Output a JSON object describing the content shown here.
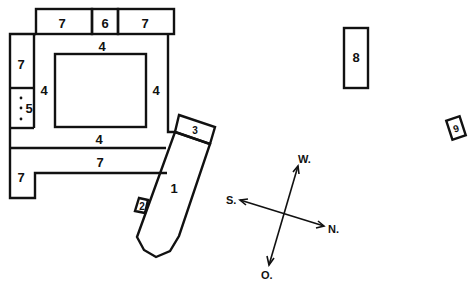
{
  "diagram": {
    "type": "site-plan",
    "buildings": [
      {
        "id": "top-left-7",
        "label": "7"
      },
      {
        "id": "top-6",
        "label": "6"
      },
      {
        "id": "top-right-7",
        "label": "7"
      },
      {
        "id": "left-7",
        "label": "7"
      },
      {
        "id": "left-5",
        "label": "5"
      },
      {
        "id": "courtyard-north-4",
        "label": "4"
      },
      {
        "id": "courtyard-west-4",
        "label": "4"
      },
      {
        "id": "courtyard-east-4",
        "label": "4"
      },
      {
        "id": "courtyard-south-4",
        "label": "4"
      },
      {
        "id": "bottom-7",
        "label": "7"
      },
      {
        "id": "bottom-left-7",
        "label": "7"
      },
      {
        "id": "building-1",
        "label": "1"
      },
      {
        "id": "building-2",
        "label": "2"
      },
      {
        "id": "building-3",
        "label": "3"
      },
      {
        "id": "building-8",
        "label": "8"
      },
      {
        "id": "building-9",
        "label": "9"
      }
    ],
    "compass": {
      "west": "W.",
      "south": "S.",
      "north": "N.",
      "east": "O."
    }
  }
}
